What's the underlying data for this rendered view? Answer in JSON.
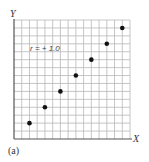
{
  "chart_data": {
    "type": "scatter",
    "title": "",
    "panel_label": "(a)",
    "annotation": "r = + 1.0",
    "xlabel": "X",
    "ylabel": "Y",
    "xlim": [
      0,
      15
    ],
    "ylim": [
      0,
      15
    ],
    "grid": true,
    "grid_divisions": 15,
    "x": [
      2,
      4,
      6,
      8,
      10,
      12,
      14
    ],
    "y": [
      2,
      4,
      6,
      8,
      10,
      12,
      14
    ],
    "point_color": "#111111",
    "grid_color": "#b8b8b8",
    "axis_color": "#555555"
  }
}
